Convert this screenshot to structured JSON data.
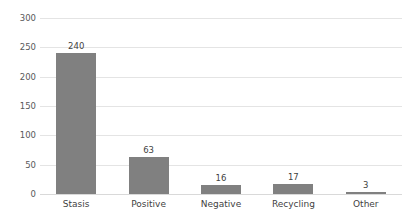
{
  "chart_data": {
    "type": "bar",
    "title": "",
    "subtitle": "",
    "xlabel": "",
    "ylabel": "",
    "categories": [
      "Stasis",
      "Positive",
      "Negative",
      "Recycling",
      "Other"
    ],
    "values": [
      240,
      63,
      16,
      17,
      3
    ],
    "data_labels": [
      "240",
      "63",
      "16",
      "17",
      "3"
    ],
    "ylim": [
      0,
      300
    ],
    "ytick_values": [
      0,
      50,
      100,
      150,
      200,
      250,
      300
    ],
    "ytick_labels": [
      "0",
      "50",
      "100",
      "150",
      "200",
      "250",
      "300"
    ],
    "grid": "horizontal",
    "legend": "none",
    "bar_color": "#808080",
    "gridline_color": "#e4e4e4",
    "text_color": "#3f3f3f",
    "axis_label_color": "#58585a",
    "background_color": "#ffffff"
  }
}
